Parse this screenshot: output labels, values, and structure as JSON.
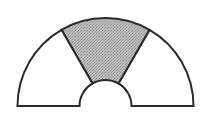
{
  "diagram": {
    "type": "semi-annulus",
    "center": [
      105.5,
      106
    ],
    "outer_radius": 88,
    "inner_radius": 26,
    "start_angle_deg": 0,
    "end_angle_deg": 180,
    "sections": [
      {
        "name": "right-section",
        "from_deg": 0,
        "to_deg": 60,
        "shaded": false
      },
      {
        "name": "middle-section",
        "from_deg": 60,
        "to_deg": 120,
        "shaded": true
      },
      {
        "name": "left-section",
        "from_deg": 120,
        "to_deg": 180,
        "shaded": false
      }
    ],
    "colors": {
      "stroke": "#2a2a2a",
      "shaded_fill": "#b4b4b4",
      "unshaded_fill": "#ffffff",
      "background": "#ffffff"
    }
  }
}
